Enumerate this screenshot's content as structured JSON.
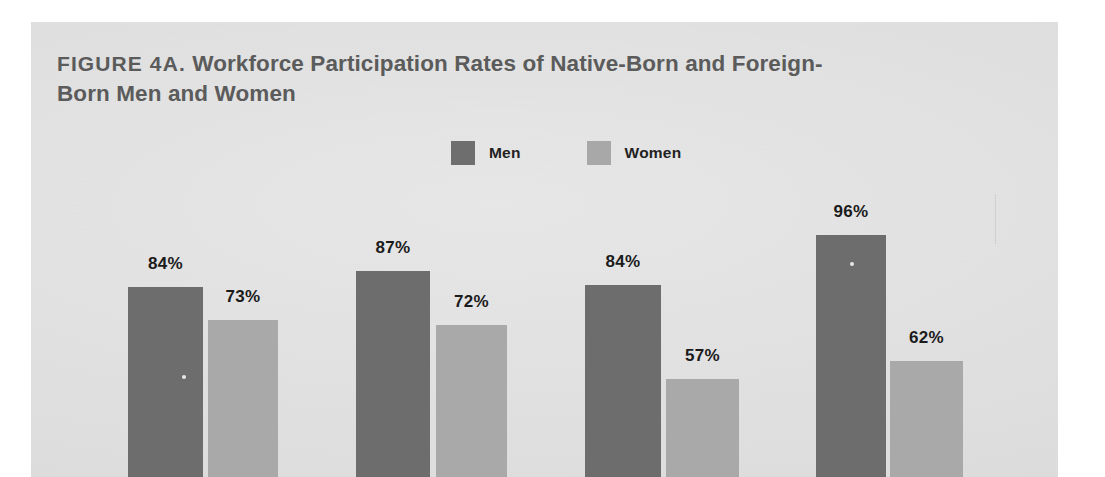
{
  "figure": {
    "label": "FIGURE 4A.",
    "title_rest": " Workforce Participation Rates of Native-Born and Foreign-Born Men and Women",
    "full_title": "FIGURE 4A. Workforce Participation Rates of Native-Born and Foreign-Born Men and Women"
  },
  "legend": {
    "items": [
      {
        "label": "Men",
        "color": "#6d6d6d",
        "swatch": "legend-swatch-men"
      },
      {
        "label": "Women",
        "color": "#a9a9a9",
        "swatch": "legend-swatch-women"
      }
    ]
  },
  "colors": {
    "panel_background": "#e4e4e4",
    "page_background": "#ffffff",
    "men_bar": "#6d6d6d",
    "women_bar": "#a9a9a9",
    "title_text": "#5b5b5b",
    "value_text": "#1b1b1b"
  },
  "chart_data": {
    "type": "bar",
    "title": "FIGURE 4A. Workforce Participation Rates of Native-Born and Foreign-Born Men and Women",
    "xlabel": "",
    "ylabel": "",
    "ylim": [
      0,
      100
    ],
    "grid": false,
    "legend_position": "top-center",
    "categories": [
      "Group 1",
      "Group 2",
      "Group 3",
      "Group 4"
    ],
    "series": [
      {
        "name": "Men",
        "color": "#6d6d6d",
        "values": [
          84,
          87,
          84,
          96
        ],
        "value_labels": [
          "84%",
          "87%",
          "84%",
          "96%"
        ]
      },
      {
        "name": "Women",
        "color": "#a9a9a9",
        "values": [
          73,
          72,
          57,
          62
        ],
        "value_labels": [
          "73%",
          "72%",
          "57%",
          "62%"
        ]
      }
    ]
  },
  "bars": [
    {
      "group": 0,
      "series": "Men",
      "label": "84%",
      "value": 84,
      "left": 97,
      "width": 75,
      "top": 265,
      "label_top": 232
    },
    {
      "group": 0,
      "series": "Women",
      "label": "73%",
      "value": 73,
      "left": 177,
      "width": 70,
      "top": 298,
      "label_top": 265
    },
    {
      "group": 1,
      "series": "Men",
      "label": "87%",
      "value": 87,
      "left": 325,
      "width": 74,
      "top": 249,
      "label_top": 216
    },
    {
      "group": 1,
      "series": "Women",
      "label": "72%",
      "value": 72,
      "left": 405,
      "width": 71,
      "top": 303,
      "label_top": 270
    },
    {
      "group": 2,
      "series": "Men",
      "label": "84%",
      "value": 84,
      "left": 554,
      "width": 76,
      "top": 263,
      "label_top": 230
    },
    {
      "group": 2,
      "series": "Women",
      "label": "57%",
      "value": 57,
      "left": 635,
      "width": 73,
      "top": 357,
      "label_top": 324
    },
    {
      "group": 3,
      "series": "Men",
      "label": "96%",
      "value": 96,
      "left": 785,
      "width": 70,
      "top": 213,
      "label_top": 180
    },
    {
      "group": 3,
      "series": "Women",
      "label": "62%",
      "value": 62,
      "left": 859,
      "width": 73,
      "top": 339,
      "label_top": 306
    }
  ]
}
